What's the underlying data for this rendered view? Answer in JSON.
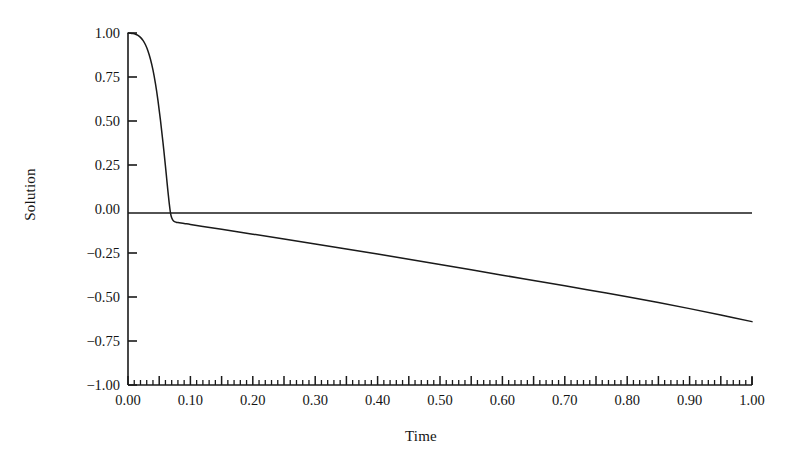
{
  "figure": {
    "background": "#ffffff",
    "line_color": "#1a1a1a",
    "axis_color": "#1a1a1a"
  },
  "chart_data": {
    "type": "line",
    "title": "",
    "subtitle": "",
    "xlabel": "Time",
    "ylabel": "Solution",
    "xlim": [
      0.0,
      1.0
    ],
    "ylim": [
      -1.0,
      1.0
    ],
    "grid": false,
    "legend": null,
    "legend_position": "none",
    "xticks": [
      0.0,
      0.1,
      0.2,
      0.3,
      0.4,
      0.5,
      0.6,
      0.7,
      0.8,
      0.9,
      1.0
    ],
    "xtick_labels": [
      "0.00",
      "0.10",
      "0.20",
      "0.30",
      "0.40",
      "0.50",
      "0.60",
      "0.70",
      "0.80",
      "0.90",
      "1.00"
    ],
    "x_minor_tick_step": 0.01,
    "x_major_tick_step": 0.05,
    "yticks": [
      1.0,
      0.75,
      0.5,
      0.25,
      0.0,
      -0.25,
      -0.5,
      -0.75,
      -1.0
    ],
    "ytick_labels": [
      "1.00",
      "0.75",
      "0.50",
      "0.25",
      "0.00",
      "-0.25",
      "-0.50",
      "-0.75",
      "-1.00"
    ],
    "zero_line": 0.0,
    "series": [
      {
        "name": "Solution",
        "color": "#1a1a1a",
        "x": [
          0.0,
          0.004,
          0.008,
          0.012,
          0.016,
          0.02,
          0.024,
          0.028,
          0.032,
          0.036,
          0.04,
          0.044,
          0.048,
          0.052,
          0.056,
          0.06,
          0.062,
          0.064,
          0.066,
          0.068,
          0.07,
          0.073,
          0.077,
          0.082,
          0.09,
          0.1,
          0.12,
          0.15,
          0.2,
          0.25,
          0.3,
          0.35,
          0.4,
          0.45,
          0.5,
          0.55,
          0.6,
          0.65,
          0.7,
          0.75,
          0.8,
          0.85,
          0.9,
          0.95,
          1.0
        ],
        "y": [
          1.0,
          0.999,
          0.997,
          0.993,
          0.986,
          0.975,
          0.958,
          0.933,
          0.898,
          0.851,
          0.79,
          0.712,
          0.617,
          0.505,
          0.38,
          0.244,
          0.172,
          0.1,
          0.035,
          -0.02,
          -0.05,
          -0.068,
          -0.075,
          -0.078,
          -0.082,
          -0.088,
          -0.099,
          -0.115,
          -0.143,
          -0.171,
          -0.199,
          -0.227,
          -0.256,
          -0.285,
          -0.315,
          -0.345,
          -0.376,
          -0.406,
          -0.436,
          -0.467,
          -0.498,
          -0.531,
          -0.566,
          -0.602,
          -0.64
        ]
      }
    ],
    "annotations": []
  },
  "labels": {
    "y_axis_title": "Solution",
    "x_axis_title": "Time"
  }
}
